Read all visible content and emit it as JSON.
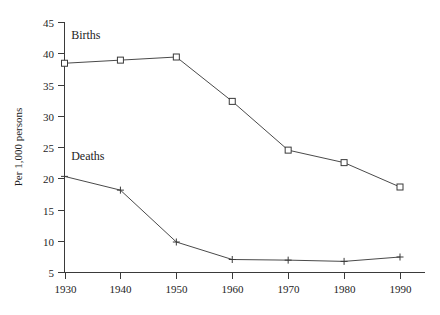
{
  "chart_data": {
    "type": "line",
    "title": "",
    "subtitle": "",
    "xlabel": "",
    "ylabel": "Per 1,000 persons",
    "categories": [
      "1930",
      "1940",
      "1950",
      "1960",
      "1970",
      "1980",
      "1990"
    ],
    "x": [
      1930,
      1940,
      1950,
      1960,
      1970,
      1980,
      1990
    ],
    "xlim": [
      1930,
      1990
    ],
    "ylim": [
      5,
      45
    ],
    "yticks": [
      5,
      10,
      15,
      20,
      25,
      30,
      35,
      40,
      45
    ],
    "ytick_labels": [
      "5",
      "10",
      "15",
      "20",
      "25",
      "30",
      "35",
      "40",
      "45"
    ],
    "xtick_labels": [
      "1930",
      "1940",
      "1950",
      "1960",
      "1970",
      "1980",
      "1990"
    ],
    "grid": false,
    "legend_position": "inline-annotation",
    "series": [
      {
        "name": "Births",
        "marker": "open-square",
        "color": "#3a3a3a",
        "values": [
          38.4,
          38.9,
          39.4,
          32.3,
          24.5,
          22.5,
          18.6
        ]
      },
      {
        "name": "Deaths",
        "marker": "plus",
        "color": "#3a3a3a",
        "values": [
          20.3,
          18.1,
          9.8,
          7.0,
          6.9,
          6.7,
          7.4
        ]
      }
    ],
    "annotations": [
      {
        "text": "Births",
        "x": 1931.2,
        "y": 42.3
      },
      {
        "text": "Deaths",
        "x": 1931.2,
        "y": 23.0
      }
    ]
  }
}
